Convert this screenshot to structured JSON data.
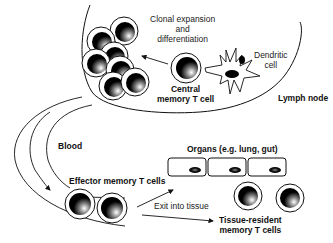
{
  "diagram": {
    "type": "biological-process",
    "regions": {
      "lymph_node": "Lymph node",
      "blood": "Blood",
      "organs": "Organs (e.g. lung, gut)"
    },
    "labels": {
      "clonal_line1": "Clonal expansion",
      "clonal_line2": "and",
      "clonal_line3": "differentiation",
      "dendritic_line1": "Dendritic",
      "dendritic_line2": "cell",
      "central_line1": "Central",
      "central_line2": "memory T cell",
      "effector": "Effector memory T cells",
      "exit": "Exit into tissue",
      "resident_line1": "Tissue-resident",
      "resident_line2": "memory T cells"
    },
    "colors": {
      "line": "#111111",
      "nucleus": "#000000",
      "background": "#ffffff"
    }
  }
}
